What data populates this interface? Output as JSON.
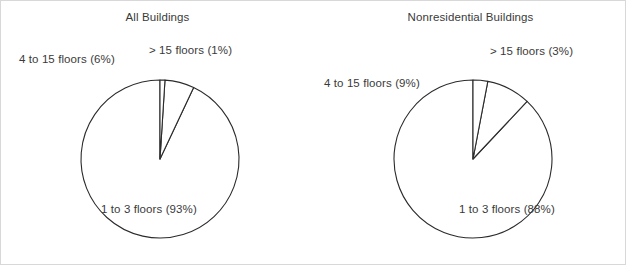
{
  "chart_data": [
    {
      "type": "pie",
      "title": "All Buildings",
      "categories": [
        "1 to 3 floors",
        "4 to 15 floors",
        "> 15 floors"
      ],
      "values": [
        93,
        6,
        1
      ],
      "labels": [
        "1 to 3 floors (93%)",
        "4 to 15 floors (6%)",
        "> 15 floors (1%)"
      ],
      "unit": "percent",
      "start_angle_deg": 90,
      "direction": "counterclockwise",
      "slice_fill": "#ffffff",
      "slice_stroke": "#2b2b2b",
      "legend": "none",
      "grid": false
    },
    {
      "type": "pie",
      "title": "Nonresidential Buildings",
      "categories": [
        "1 to 3 floors",
        "4 to 15 floors",
        "> 15 floors"
      ],
      "values": [
        88,
        9,
        3
      ],
      "labels": [
        "1 to 3 floors (88%)",
        "4 to 15 floors (9%)",
        "> 15 floors (3%)"
      ],
      "unit": "percent",
      "start_angle_deg": 90,
      "direction": "counterclockwise",
      "slice_fill": "#ffffff",
      "slice_stroke": "#2b2b2b",
      "legend": "none",
      "grid": false
    }
  ],
  "panels": {
    "left": {
      "title": "All Buildings",
      "label_low": "1 to 3 floors (93%)",
      "label_mid": "4 to 15 floors (6%)",
      "label_high": "> 15 floors (1%)"
    },
    "right": {
      "title": "Nonresidential Buildings",
      "label_low": "1 to 3 floors (88%)",
      "label_mid": "4 to 15 floors (9%)",
      "label_high": "> 15 floors (3%)"
    }
  },
  "colors": {
    "text": "#3a3a3a",
    "stroke": "#2b2b2b",
    "background": "#ffffff",
    "frame": "#d8d8d8"
  }
}
